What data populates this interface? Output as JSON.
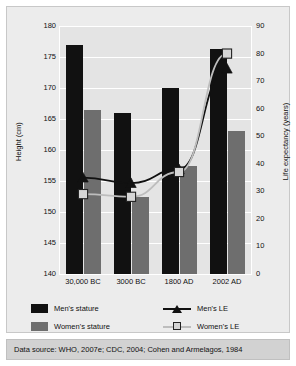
{
  "chart_data": {
    "type": "bar",
    "title": "",
    "subtitle": "",
    "categories": [
      "30,000 BC",
      "3000 BC",
      "1800 AD",
      "2002 AD"
    ],
    "xlabel": "",
    "ylabel": "Height (cm)",
    "y2label": "Life expectancy (years)",
    "ylim": [
      140,
      180
    ],
    "y2lim": [
      0,
      90
    ],
    "ytick_labels": [
      "180",
      "175",
      "170",
      "165",
      "160",
      "155",
      "150",
      "145",
      "140"
    ],
    "yticks": [
      180,
      175,
      170,
      165,
      160,
      155,
      150,
      145,
      140
    ],
    "y2tick_labels": [
      "90",
      "80",
      "70",
      "60",
      "50",
      "40",
      "30",
      "20",
      "10",
      "0"
    ],
    "y2ticks": [
      90,
      80,
      70,
      60,
      50,
      40,
      30,
      20,
      10,
      0
    ],
    "grid": true,
    "legend_position": "bottom",
    "series": [
      {
        "name": "Men's stature",
        "kind": "bar",
        "axis": "left",
        "unit": "cm",
        "color": "#111111",
        "values": [
          177.0,
          166.0,
          170.0,
          176.3
        ]
      },
      {
        "name": "Women's stature",
        "kind": "bar",
        "axis": "left",
        "unit": "cm",
        "color": "#6e6e6e",
        "values": [
          166.5,
          152.5,
          157.5,
          163.0
        ]
      },
      {
        "name": "Men's LE",
        "kind": "line",
        "axis": "right",
        "unit": "years",
        "color": "#111111",
        "marker": "triangle",
        "values": [
          35,
          33,
          38,
          74.5
        ]
      },
      {
        "name": "Women's LE",
        "kind": "line",
        "axis": "right",
        "unit": "years",
        "color": "#bdbdbd",
        "marker": "square",
        "values": [
          29,
          28,
          37,
          80
        ]
      }
    ]
  },
  "legend": {
    "entries": [
      {
        "label": "Men's stature",
        "type": "swatch",
        "color": "#111111"
      },
      {
        "label": "Women's stature",
        "type": "swatch",
        "color": "#6e6e6e"
      },
      {
        "label": "Men's LE",
        "type": "line-triangle",
        "color": "#111111"
      },
      {
        "label": "Women's LE",
        "type": "line-square",
        "color": "#bdbdbd"
      }
    ]
  },
  "source": {
    "text": "Data source: WHO, 2007e; CDC, 2004; Cohen and Armelagos, 1984"
  },
  "colors": {
    "men": "#111111",
    "women": "#6e6e6e",
    "plot_background": "#e4e4e4",
    "card_background": "#ececec",
    "gridline": "#ffffff",
    "source_background": "#d2d2d2"
  }
}
